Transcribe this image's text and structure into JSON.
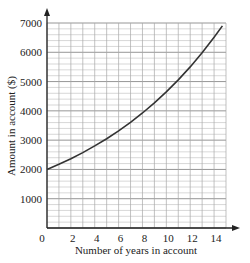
{
  "chart_data": {
    "type": "line",
    "title": "",
    "xlabel": "Number of years in account",
    "ylabel": "Amount in account ($)",
    "xlim": [
      0,
      15
    ],
    "ylim": [
      0,
      7000
    ],
    "xticks": [
      0,
      2,
      4,
      6,
      8,
      10,
      12,
      14
    ],
    "yticks": [
      1000,
      2000,
      3000,
      4000,
      5000,
      6000,
      7000
    ],
    "grid": true,
    "grid_minor": {
      "x_step": 1,
      "y_step": 200
    },
    "legend": null,
    "series": [
      {
        "name": "Amount in account",
        "x": [
          0,
          1,
          2,
          3,
          4,
          5,
          6,
          7,
          8,
          9,
          10,
          11,
          12,
          13,
          14,
          14.7
        ],
        "values": [
          2000,
          2176,
          2367,
          2576,
          2802,
          3049,
          3317,
          3609,
          3927,
          4272,
          4648,
          5057,
          5502,
          5986,
          6513,
          6900
        ]
      }
    ],
    "growth_rate_estimate": 1.088
  }
}
